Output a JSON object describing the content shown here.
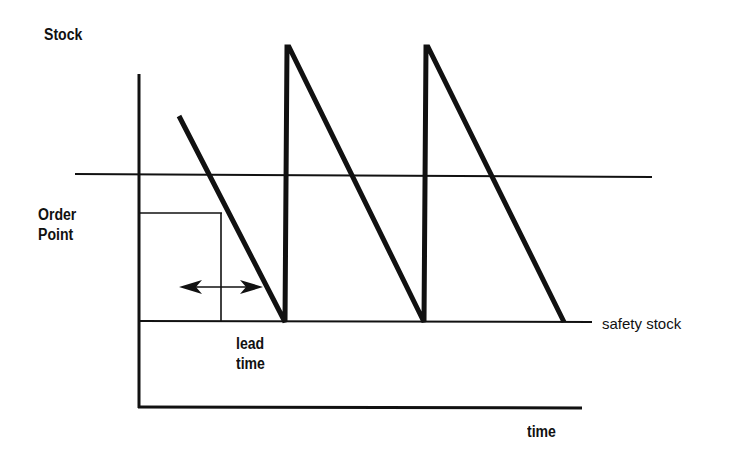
{
  "diagram": {
    "labels": {
      "y_axis": "Stock",
      "x_axis": "time",
      "order_point_line1": "Order",
      "order_point_line2": "Point",
      "lead_time_line1": "lead",
      "lead_time_line2": "time",
      "safety_stock": "safety stock"
    },
    "colors": {
      "ink": "#111111",
      "background": "#ffffff"
    }
  }
}
